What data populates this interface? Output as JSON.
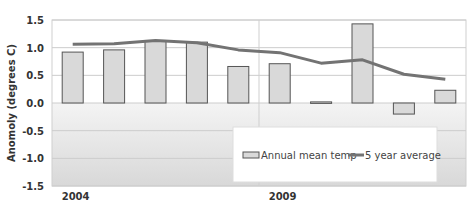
{
  "chart_data": {
    "type": "bar",
    "title": "",
    "xlabel": "",
    "ylabel": "Anomoly (degrees C)",
    "ylim": [
      -1.5,
      1.5
    ],
    "yticks": [
      "1.5",
      "1.0",
      "0.5",
      "0.0",
      "-0.5",
      "-1.0",
      "-1.5"
    ],
    "x_tick_labels": [
      {
        "label": "2004",
        "index": 0
      },
      {
        "label": "2009",
        "index": 5
      }
    ],
    "categories": [
      "2004",
      "2005",
      "2006",
      "2007",
      "2008",
      "2009",
      "2010",
      "2011",
      "2012",
      "2013"
    ],
    "series": [
      {
        "name": "Annual mean temp",
        "type": "bar",
        "values": [
          0.92,
          0.96,
          1.13,
          1.1,
          0.66,
          0.71,
          0.02,
          1.43,
          -0.2,
          0.23
        ]
      },
      {
        "name": "5 year average",
        "type": "line",
        "values": [
          1.06,
          1.07,
          1.13,
          1.09,
          0.96,
          0.91,
          0.72,
          0.78,
          0.52,
          0.43
        ]
      }
    ],
    "grid": true,
    "legend_position": "lower right inside",
    "colors": {
      "bar_fill": "#d9d9d9",
      "bar_stroke": "#555555",
      "line": "#737373",
      "grid": "#cccccc"
    }
  }
}
